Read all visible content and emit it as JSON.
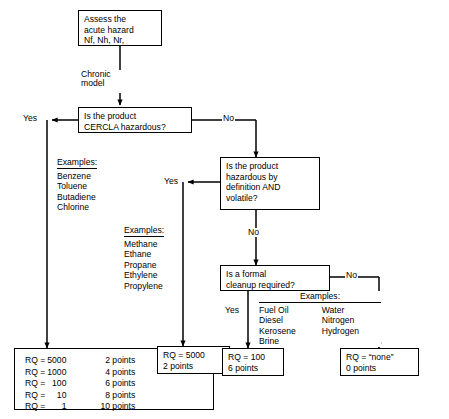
{
  "diagram": {
    "background": "#ffffff",
    "line_color": "#000000"
  },
  "nodes": {
    "start": {
      "text": "Assess the\nacute hazard\nNf, Nh, Nr,"
    },
    "q1": {
      "text": "Is the product\nCERCLA hazardous?"
    },
    "q2": {
      "text": "Is the product\nhazardous by\ndefinition AND\nvolatile?"
    },
    "q3": {
      "text": "Is a formal\ncleanup required?"
    },
    "result_mid": {
      "text": "RQ = 5000\n2 points"
    },
    "result_cleanup": {
      "text": "RQ = 100\n6 points"
    },
    "result_none": {
      "text": "RQ = “none”\n0 points"
    }
  },
  "edge_labels": {
    "chronic_model": "Chronic\nmodel",
    "q1_yes": "Yes",
    "q1_no": "No",
    "q2_yes": "Yes",
    "q2_no": "No",
    "q3_yes": "Yes",
    "q3_no": "No"
  },
  "examples": {
    "cercla": {
      "header": "Examples:",
      "items": [
        "Benzene",
        "Toluene",
        "Butadiene",
        "Chlorine"
      ]
    },
    "volatile": {
      "header": "Examples:",
      "items": [
        "Methane",
        "Ethane",
        "Propane",
        "Ethylene",
        "Propylene"
      ]
    },
    "cleanup": {
      "header": "Examples:",
      "col1": [
        "Fuel Oil",
        "Diesel",
        "Kerosene",
        "Brine"
      ],
      "col2": [
        "Water",
        "Nitrogen",
        "Hydrogen"
      ]
    }
  },
  "rq_table": {
    "rows": [
      {
        "label": "RQ =",
        "value": "5000",
        "points": "2 points"
      },
      {
        "label": "RQ =",
        "value": "1000",
        "points": "4 points"
      },
      {
        "label": "RQ =",
        "value": "100",
        "points": "6 points"
      },
      {
        "label": "RQ =",
        "value": "10",
        "points": "8 points"
      },
      {
        "label": "RQ =",
        "value": "1",
        "points": "10 points"
      }
    ]
  }
}
